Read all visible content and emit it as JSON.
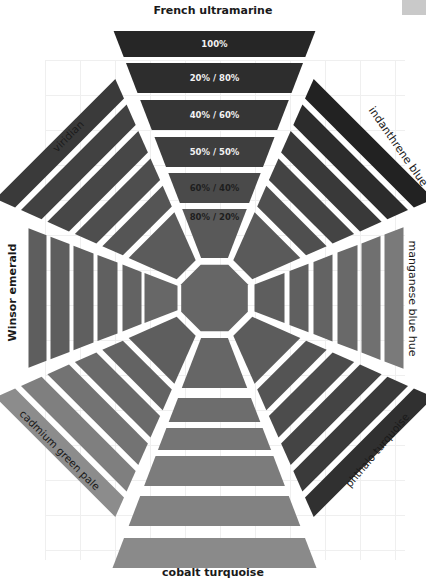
{
  "title": "French ultramarine",
  "center": {
    "x": 214.5,
    "y": 298
  },
  "top_arm": {
    "label": "French ultramarine",
    "bars": [
      {
        "label": "100%",
        "color": "#262626",
        "text_color": "#f2f2f2"
      },
      {
        "label": "20% / 80%",
        "color": "#2d2d2d",
        "text_color": "#f2f2f2"
      },
      {
        "label": "40% / 60%",
        "color": "#353535",
        "text_color": "#f2f2f2"
      },
      {
        "label": "50% / 50%",
        "color": "#3e3e3e",
        "text_color": "#f2f2f2"
      },
      {
        "label": "60% / 40%",
        "color": "#4a4a4a",
        "text_color": "#1e1e1e"
      },
      {
        "label": "80% / 20%",
        "color": "#595959",
        "text_color": "#1e1e1e"
      }
    ]
  },
  "arms": [
    {
      "name": "french-ultramarine",
      "label": "French ultramarine",
      "angle": 0,
      "colors": [
        "#262626",
        "#2d2d2d",
        "#353535",
        "#3e3e3e",
        "#4a4a4a",
        "#595959"
      ]
    },
    {
      "name": "indanthrene-blue",
      "label": "indanthrene blue",
      "angle": 45,
      "colors": [
        "#222222",
        "#2c2c2c",
        "#393939",
        "#444444",
        "#4f4f4f",
        "#5a5a5a"
      ]
    },
    {
      "name": "manganese-blue-hue",
      "label": "manganese blue hue",
      "angle": 90,
      "colors": [
        "#7a7a7a",
        "#707070",
        "#696969",
        "#636363",
        "#606060",
        "#5e5e5e"
      ]
    },
    {
      "name": "phthalo-turquoise",
      "label": "phthalo turquoise",
      "angle": 135,
      "colors": [
        "#303030",
        "#3a3a3a",
        "#444444",
        "#4c4c4c",
        "#545454",
        "#5c5c5c"
      ]
    },
    {
      "name": "cobalt-turquoise",
      "label": "cobalt turquoise",
      "angle": 180,
      "colors": [
        "#8a8a8a",
        "#828282",
        "#7c7c7c",
        "#757575",
        "#6d6d6d",
        "#666666"
      ]
    },
    {
      "name": "cadmium-green-pale",
      "label": "cadmium green pale",
      "angle": 225,
      "colors": [
        "#8c8c8c",
        "#7f7f7f",
        "#737373",
        "#6a6a6a",
        "#636363",
        "#5e5e5e"
      ]
    },
    {
      "name": "winsor-emerald",
      "label": "Winsor emerald",
      "angle": 270,
      "colors": [
        "#5e5e5e",
        "#5e5e5e",
        "#5f5f5f",
        "#606060",
        "#636363",
        "#676767"
      ]
    },
    {
      "name": "viridian",
      "label": "viridian",
      "angle": 315,
      "colors": [
        "#3a3a3a",
        "#414141",
        "#474747",
        "#4e4e4e",
        "#555555",
        "#5b5b5b"
      ]
    }
  ],
  "center_octagon": {
    "color": "#666666"
  },
  "labels": {
    "top": "French ultramarine",
    "top_right": "indanthrene blue",
    "right": "manganese blue hue",
    "bottom_right": "phthalo turquoise",
    "bottom": "cobalt turquoise",
    "bottom_left": "cadmium green pale",
    "left": "Winsor emerald",
    "top_left": "viridian"
  }
}
